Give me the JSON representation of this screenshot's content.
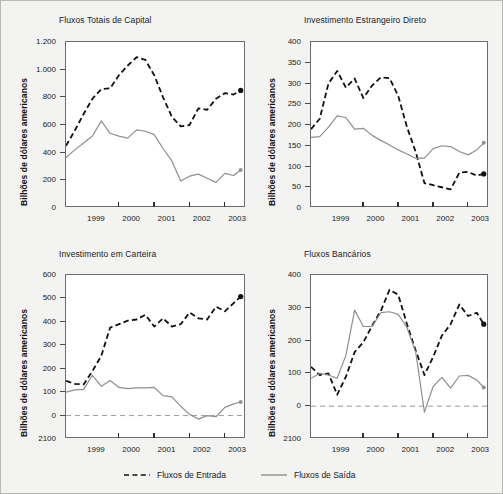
{
  "figure": {
    "ylabel": "Bilhões de dólares americanos",
    "xticklabels": [
      "1999",
      "2000",
      "2001",
      "2002",
      "2003"
    ],
    "colors": {
      "inflow": "#111111",
      "outflow": "#8f8f8f",
      "frame": "#6d6d6d",
      "background": "#f3f3f1",
      "plot_background": "#ffffff",
      "zero_line": "#9a9a9a"
    }
  },
  "legend": {
    "position": "bottom-center",
    "entries": [
      {
        "label": "Fluxos de Entrada",
        "style": "dashed",
        "color": "#111111"
      },
      {
        "label": "Fluxos de Saída",
        "style": "solid",
        "color": "#8f8f8f"
      }
    ]
  },
  "chart_data": [
    {
      "type": "line",
      "title": "Fluxos Totais de Capital",
      "xlabel": "",
      "ylabel": "Bilhões de dólares americanos",
      "xlim": [
        1998.5,
        2003.6
      ],
      "ylim": [
        0,
        1200
      ],
      "yticks": [
        0,
        200,
        400,
        600,
        800,
        1000,
        1200
      ],
      "yticklabels": [
        "0",
        "200",
        "400",
        "600",
        "800",
        "1.000",
        "1.200"
      ],
      "xticks": [
        1999,
        2000,
        2001,
        2002,
        2003
      ],
      "xticklabels": [
        "1999",
        "2000",
        "2001",
        "2002",
        "2003"
      ],
      "grid": false,
      "x": [
        1998.5,
        1998.75,
        1999.0,
        1999.25,
        1999.5,
        1999.75,
        2000.0,
        2000.25,
        2000.5,
        2000.75,
        2001.0,
        2001.25,
        2001.5,
        2001.75,
        2002.0,
        2002.25,
        2002.5,
        2002.75,
        2003.0,
        2003.25,
        2003.45
      ],
      "series": [
        {
          "name": "Fluxos de Entrada",
          "style": "dashed",
          "color": "#111111",
          "endpoint_marker": true,
          "values": [
            450,
            560,
            680,
            790,
            860,
            865,
            960,
            1030,
            1090,
            1070,
            960,
            800,
            660,
            590,
            600,
            720,
            710,
            790,
            830,
            820,
            850
          ]
        },
        {
          "name": "Fluxos de Saída",
          "style": "solid",
          "color": "#8f8f8f",
          "endpoint_marker": true,
          "values": [
            365,
            420,
            470,
            520,
            630,
            540,
            520,
            505,
            565,
            555,
            530,
            430,
            340,
            195,
            230,
            245,
            215,
            185,
            250,
            235,
            275
          ]
        }
      ]
    },
    {
      "type": "line",
      "title": "Investimento Estrangeiro Direto",
      "xlabel": "",
      "ylabel": "Bilhões de dólares americanos",
      "xlim": [
        1998.5,
        2003.6
      ],
      "ylim": [
        0,
        400
      ],
      "yticks": [
        0,
        50,
        100,
        150,
        200,
        250,
        300,
        350,
        400
      ],
      "yticklabels": [
        "0",
        "50",
        "100",
        "150",
        "200",
        "250",
        "300",
        "350",
        "400"
      ],
      "xticks": [
        1999,
        2000,
        2001,
        2002,
        2003
      ],
      "xticklabels": [
        "1999",
        "2000",
        "2001",
        "2002",
        "2003"
      ],
      "grid": false,
      "x": [
        1998.5,
        1998.75,
        1999.0,
        1999.25,
        1999.5,
        1999.75,
        2000.0,
        2000.25,
        2000.5,
        2000.75,
        2001.0,
        2001.25,
        2001.5,
        2001.75,
        2002.0,
        2002.25,
        2002.5,
        2002.75,
        2003.0,
        2003.25,
        2003.45
      ],
      "series": [
        {
          "name": "Fluxos de Entrada",
          "style": "dashed",
          "color": "#111111",
          "endpoint_marker": true,
          "values": [
            190,
            215,
            300,
            330,
            290,
            312,
            265,
            295,
            315,
            313,
            270,
            195,
            135,
            60,
            55,
            50,
            45,
            85,
            87,
            78,
            82
          ]
        },
        {
          "name": "Fluxos de Saída",
          "style": "solid",
          "color": "#8f8f8f",
          "endpoint_marker": true,
          "values": [
            170,
            172,
            195,
            222,
            218,
            190,
            192,
            175,
            163,
            152,
            140,
            130,
            120,
            120,
            143,
            150,
            148,
            136,
            128,
            140,
            157
          ]
        }
      ]
    },
    {
      "type": "line",
      "title": "Investimento em Carteira",
      "xlabel": "",
      "ylabel": "Bilhões de dólares americanos",
      "xlim": [
        1998.5,
        2003.6
      ],
      "ylim": [
        -100,
        600
      ],
      "yticks": [
        -100,
        0,
        100,
        200,
        300,
        400,
        500,
        600
      ],
      "yticklabels": [
        "2100",
        "0",
        "100",
        "200",
        "300",
        "400",
        "500",
        "600"
      ],
      "xticks": [
        1999,
        2000,
        2001,
        2002,
        2003
      ],
      "xticklabels": [
        "1999",
        "2000",
        "2001",
        "2002",
        "2003"
      ],
      "grid": false,
      "zero_line": true,
      "x": [
        1998.5,
        1998.75,
        1999.0,
        1999.25,
        1999.5,
        1999.75,
        2000.0,
        2000.25,
        2000.5,
        2000.75,
        2001.0,
        2001.25,
        2001.5,
        2001.75,
        2002.0,
        2002.25,
        2002.5,
        2002.75,
        2003.0,
        2003.25,
        2003.45
      ],
      "series": [
        {
          "name": "Fluxos de Entrada",
          "style": "dashed",
          "color": "#111111",
          "endpoint_marker": true,
          "values": [
            148,
            135,
            133,
            190,
            255,
            375,
            390,
            405,
            410,
            430,
            380,
            415,
            380,
            390,
            440,
            415,
            410,
            465,
            445,
            480,
            508
          ]
        },
        {
          "name": "Fluxos de Saída",
          "style": "solid",
          "color": "#8f8f8f",
          "endpoint_marker": true,
          "values": [
            100,
            110,
            112,
            172,
            125,
            150,
            120,
            115,
            118,
            118,
            120,
            85,
            80,
            40,
            5,
            -15,
            0,
            -5,
            35,
            50,
            58
          ]
        }
      ]
    },
    {
      "type": "line",
      "title": "Fluxos Bancários",
      "xlabel": "",
      "ylabel": "Bilhões de dólares americanos",
      "xlim": [
        1998.5,
        2003.6
      ],
      "ylim": [
        -100,
        400
      ],
      "yticks": [
        -100,
        0,
        100,
        200,
        300,
        400
      ],
      "yticklabels": [
        "2100",
        "0",
        "100",
        "200",
        "300",
        "400"
      ],
      "xticks": [
        1999,
        2000,
        2001,
        2002,
        2003
      ],
      "xticklabels": [
        "1999",
        "2000",
        "2001",
        "2002",
        "2003"
      ],
      "grid": false,
      "zero_line": true,
      "x": [
        1998.5,
        1998.75,
        1999.0,
        1999.25,
        1999.5,
        1999.75,
        2000.0,
        2000.25,
        2000.5,
        2000.75,
        2001.0,
        2001.25,
        2001.5,
        2001.75,
        2002.0,
        2002.25,
        2002.5,
        2002.75,
        2003.0,
        2003.25,
        2003.45
      ],
      "series": [
        {
          "name": "Fluxos de Entrada",
          "style": "dashed",
          "color": "#111111",
          "endpoint_marker": true,
          "values": [
            120,
            95,
            100,
            35,
            90,
            165,
            195,
            245,
            290,
            355,
            340,
            250,
            170,
            95,
            150,
            215,
            250,
            310,
            275,
            285,
            250
          ]
        },
        {
          "name": "Fluxos de Saída",
          "style": "solid",
          "color": "#8f8f8f",
          "endpoint_marker": true,
          "values": [
            85,
            100,
            95,
            85,
            155,
            293,
            243,
            243,
            285,
            288,
            280,
            240,
            165,
            -18,
            60,
            88,
            55,
            92,
            94,
            80,
            57
          ]
        }
      ]
    }
  ]
}
